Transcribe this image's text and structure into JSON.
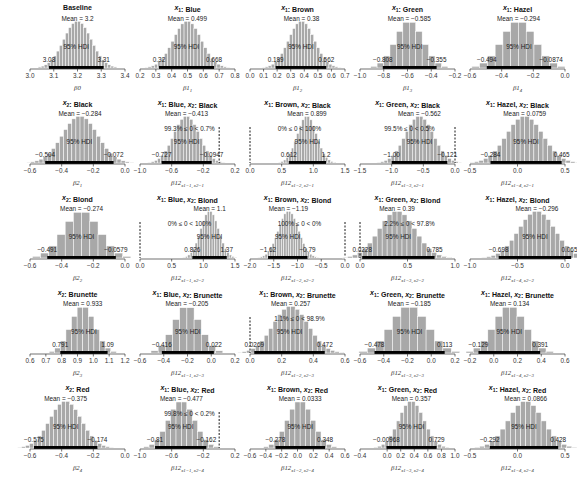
{
  "chart_data": {
    "type": "histogram-grid",
    "title": "",
    "layout": {
      "rows": 5,
      "cols": 5
    },
    "hdi_label": "95% HDI",
    "colors": {
      "bars": "#a8a8a8",
      "bar_edge": "#ffffff",
      "hdi": "#000000",
      "axis": "#333333"
    },
    "panels": [
      {
        "id": "b0",
        "row": 0,
        "col": 0,
        "title": "Baseline",
        "xlabel": "β0",
        "xlim": [
          3.0,
          3.4
        ],
        "ticks": [
          3.0,
          3.1,
          3.2,
          3.3,
          3.4
        ],
        "mean": 3.2,
        "mean_label": "Mean = 3.2",
        "hdi": [
          3.08,
          3.31
        ],
        "hdi_labels": [
          "3.08",
          "3.31"
        ],
        "sd": 0.058,
        "nbins": 30
      },
      {
        "id": "b1_1",
        "row": 0,
        "col": 1,
        "title": "x1: Blue",
        "xlabel": "β1_1",
        "xlim": [
          0.2,
          0.8
        ],
        "ticks": [
          0.2,
          0.3,
          0.4,
          0.5,
          0.6,
          0.7,
          0.8
        ],
        "mean": 0.499,
        "mean_label": "Mean = 0.499",
        "hdi": [
          0.32,
          0.668
        ],
        "hdi_labels": [
          "0.32",
          "0.668"
        ],
        "sd": 0.088,
        "nbins": 28
      },
      {
        "id": "b1_2",
        "row": 0,
        "col": 2,
        "title": "x1: Brown",
        "xlabel": "β1_2",
        "xlim": [
          0.0,
          0.7
        ],
        "ticks": [
          0.0,
          0.1,
          0.2,
          0.3,
          0.4,
          0.5,
          0.6,
          0.7
        ],
        "mean": 0.38,
        "mean_label": "Mean = 0.38",
        "hdi": [
          0.189,
          0.562
        ],
        "hdi_labels": [
          "0.189",
          "0.562"
        ],
        "sd": 0.095,
        "nbins": 28
      },
      {
        "id": "b1_3",
        "row": 0,
        "col": 3,
        "title": "x1: Green",
        "xlabel": "β1_3",
        "xlim": [
          -1.0,
          -0.2
        ],
        "ticks": [
          -1.0,
          -0.8,
          -0.6,
          -0.4,
          -0.2
        ],
        "mean": -0.585,
        "mean_label": "Mean = -0.585",
        "hdi": [
          -0.808,
          -0.355
        ],
        "hdi_labels": [
          "-0.808",
          "-0.355"
        ],
        "sd": 0.115,
        "nbins": 14
      },
      {
        "id": "b1_4",
        "row": 0,
        "col": 4,
        "title": "x1: Hazel",
        "xlabel": "β1_4",
        "xlim": [
          -0.6,
          0.0
        ],
        "ticks": [
          -0.6,
          -0.4,
          -0.2,
          0.0
        ],
        "mean": -0.294,
        "mean_label": "Mean = -0.294",
        "hdi": [
          -0.494,
          -0.0874
        ],
        "hdi_labels": [
          "-0.494",
          "-0.0874"
        ],
        "sd": 0.104,
        "nbins": 14
      },
      {
        "id": "b2_1",
        "row": 1,
        "col": 0,
        "title": "x2: Black",
        "xlabel": "β2_1",
        "xlim": [
          -0.6,
          0.0
        ],
        "ticks": [
          -0.6,
          -0.4,
          -0.2,
          0.0
        ],
        "mean": -0.284,
        "mean_label": "Mean = -0.284",
        "hdi": [
          -0.504,
          -0.072
        ],
        "hdi_labels": [
          "-0.504",
          "-0.072"
        ],
        "sd": 0.11,
        "nbins": 28
      },
      {
        "id": "b12_11",
        "row": 1,
        "col": 1,
        "title": "x1: Blue, x2: Black",
        "xlabel": "β12_{x1=1, x2=1}",
        "xlim": [
          -1.0,
          0.2
        ],
        "ticks": [
          -1.0,
          -0.6,
          -0.2,
          0.2
        ],
        "mean": -0.413,
        "mean_label": "Mean = -0.413",
        "hdi": [
          -0.727,
          -0.0947
        ],
        "hdi_labels": [
          "-0.727",
          "-0.0947"
        ],
        "sd": 0.16,
        "nbins": 26,
        "comp_label": "99.3% ≤ 0 < 0.7%",
        "comp_value": 0
      },
      {
        "id": "b12_21",
        "row": 1,
        "col": 2,
        "title": "x1: Brown, x2: Black",
        "xlabel": "β12_{x1=2, x2=1}",
        "xlim": [
          0.0,
          1.5
        ],
        "ticks": [
          0.0,
          0.5,
          1.0,
          1.5
        ],
        "mean": 0.899,
        "mean_label": "Mean = 0.899",
        "hdi": [
          0.612,
          1.2
        ],
        "hdi_labels": [
          "0.612",
          "1.2"
        ],
        "sd": 0.15,
        "nbins": 24,
        "comp_label": "0% ≤ 0 < 100%",
        "comp_value": 0
      },
      {
        "id": "b12_31",
        "row": 1,
        "col": 3,
        "title": "x1: Green, x2: Black",
        "xlabel": "β12_{x1=3, x2=1}",
        "xlim": [
          -1.5,
          0.0
        ],
        "ticks": [
          -1.5,
          -1.0,
          -0.5,
          0.0
        ],
        "mean": -0.562,
        "mean_label": "Mean = -0.562",
        "hdi": [
          -1.0,
          -0.121
        ],
        "hdi_labels": [
          "-1.00",
          "-0.121"
        ],
        "sd": 0.22,
        "nbins": 26,
        "comp_label": "99.5% ≤ 0 < 0.5%",
        "comp_value": 0
      },
      {
        "id": "b12_41",
        "row": 1,
        "col": 4,
        "title": "x1: Hazel, x2: Black",
        "xlabel": "β12_{x1=4, x2=1}",
        "xlim": [
          -0.5,
          0.5
        ],
        "ticks": [
          -0.5,
          0.0,
          0.5
        ],
        "mean": 0.0759,
        "mean_label": "Mean = 0.0759",
        "hdi": [
          -0.284,
          0.465
        ],
        "hdi_labels": [
          "-0.284",
          "0.465"
        ],
        "sd": 0.19,
        "nbins": 26
      },
      {
        "id": "b2_2",
        "row": 2,
        "col": 0,
        "title": "x2: Blond",
        "xlabel": "β2_2",
        "xlim": [
          -0.6,
          0.0
        ],
        "ticks": [
          -0.6,
          -0.4,
          -0.2,
          0.0
        ],
        "mean": -0.274,
        "mean_label": "Mean = -0.274",
        "hdi": [
          -0.491,
          -0.0579
        ],
        "hdi_labels": [
          "-0.491",
          "-0.0579"
        ],
        "sd": 0.11,
        "nbins": 14
      },
      {
        "id": "b12_12",
        "row": 2,
        "col": 1,
        "title": "x1: Blue, x2: Blond",
        "xlabel": "β12_{x1=1, x2=2}",
        "xlim": [
          0.0,
          1.5
        ],
        "ticks": [
          0.0,
          0.5,
          1.0,
          1.5
        ],
        "mean": 1.1,
        "mean_label": "Mean = 1.1",
        "hdi": [
          0.826,
          1.37
        ],
        "hdi_labels": [
          "0.826",
          "1.37"
        ],
        "sd": 0.14,
        "nbins": 24,
        "comp_label": "0% ≤ 0 < 100%",
        "comp_value": 0
      },
      {
        "id": "b12_22",
        "row": 2,
        "col": 2,
        "title": "x1: Brown, x2: Blond",
        "xlabel": "β12_{x1=2, x2=2}",
        "xlim": [
          -2.0,
          0.0
        ],
        "ticks": [
          -2.0,
          -1.5,
          -1.0,
          -0.5,
          0.0
        ],
        "mean": -1.19,
        "mean_label": "Mean = -1.19",
        "hdi": [
          -1.62,
          -0.79
        ],
        "hdi_labels": [
          "-1.62",
          "-0.79"
        ],
        "sd": 0.21,
        "nbins": 28,
        "comp_label": "100% ≤ 0 < 0%",
        "comp_value": 0
      },
      {
        "id": "b12_32",
        "row": 2,
        "col": 3,
        "title": "x1: Green, x2: Blond",
        "xlabel": "β12_{x1=3, x2=2}",
        "xlim": [
          0.0,
          1.0
        ],
        "ticks": [
          0.0,
          0.5,
          1.0
        ],
        "mean": 0.39,
        "mean_label": "Mean = 0.39",
        "hdi": [
          0.0228,
          0.785
        ],
        "hdi_labels": [
          "0.0228",
          "0.785"
        ],
        "sd": 0.19,
        "nbins": 24,
        "comp_label": "2.2% ≤ 0 < 97.8%",
        "comp_value": 0
      },
      {
        "id": "b12_42",
        "row": 2,
        "col": 4,
        "title": "x1: Hazel, x2: Blond",
        "xlabel": "β12_{x1=4, x2=2}",
        "xlim": [
          -1.0,
          0.0
        ],
        "ticks": [
          -1.0,
          -0.5,
          0.0
        ],
        "mean": -0.296,
        "mean_label": "Mean = -0.296",
        "hdi": [
          -0.698,
          0.0655
        ],
        "hdi_labels": [
          "-0.698",
          "0.0655"
        ],
        "sd": 0.19,
        "nbins": 26
      },
      {
        "id": "b2_3",
        "row": 3,
        "col": 0,
        "title": "x2: Brunette",
        "xlabel": "β2_3",
        "xlim": [
          0.6,
          1.2
        ],
        "ticks": [
          0.6,
          0.7,
          0.8,
          0.9,
          1.0,
          1.1,
          1.2
        ],
        "mean": 0.933,
        "mean_label": "Mean = 0.933",
        "hdi": [
          0.791,
          1.09
        ],
        "hdi_labels": [
          "0.791",
          "1.09"
        ],
        "sd": 0.075,
        "nbins": 14
      },
      {
        "id": "b12_13",
        "row": 3,
        "col": 1,
        "title": "x1: Blue, x2: Brunette",
        "xlabel": "β12_{x1=1, x2=3}",
        "xlim": [
          -0.6,
          0.2
        ],
        "ticks": [
          -0.6,
          -0.4,
          -0.2,
          0.0,
          0.2
        ],
        "mean": -0.205,
        "mean_label": "Mean = -0.205",
        "hdi": [
          -0.416,
          0.022
        ],
        "hdi_labels": [
          "-0.416",
          "0.022"
        ],
        "sd": 0.11,
        "nbins": 12
      },
      {
        "id": "b12_23",
        "row": 3,
        "col": 2,
        "title": "x1: Brown, x2: Brunette",
        "xlabel": "β12_{x1=2, x2=3}",
        "xlim": [
          0.0,
          0.6
        ],
        "ticks": [
          0.0,
          0.2,
          0.4,
          0.6
        ],
        "mean": 0.257,
        "mean_label": "Mean = 0.257",
        "hdi": [
          0.0269,
          0.472
        ],
        "hdi_labels": [
          "0.0269",
          "0.472"
        ],
        "sd": 0.11,
        "nbins": 26,
        "comp_label": "1.1% ≤ 0 < 98.9%",
        "comp_value": 0
      },
      {
        "id": "b12_33",
        "row": 3,
        "col": 3,
        "title": "x1: Green, x2: Brunette",
        "xlabel": "β12_{x1=3, x2=3}",
        "xlim": [
          -0.6,
          0.2
        ],
        "ticks": [
          -0.6,
          -0.4,
          -0.2,
          0.0,
          0.2
        ],
        "mean": -0.185,
        "mean_label": "Mean = -0.185",
        "hdi": [
          -0.478,
          0.113
        ],
        "hdi_labels": [
          "-0.478",
          "0.113"
        ],
        "sd": 0.15,
        "nbins": 14
      },
      {
        "id": "b12_43",
        "row": 3,
        "col": 4,
        "title": "x1: Hazel, x2: Brunette",
        "xlabel": "β12_{x1=4, x2=3}",
        "xlim": [
          -0.2,
          0.6
        ],
        "ticks": [
          -0.2,
          0.0,
          0.2,
          0.4,
          0.6
        ],
        "mean": 0.134,
        "mean_label": "Mean = 0.134",
        "hdi": [
          -0.129,
          0.391
        ],
        "hdi_labels": [
          "-0.129",
          "0.391"
        ],
        "sd": 0.13,
        "nbins": 14
      },
      {
        "id": "b2_4",
        "row": 4,
        "col": 0,
        "title": "x2: Red",
        "xlabel": "β2_4",
        "xlim": [
          -0.6,
          0.0
        ],
        "ticks": [
          -0.6,
          -0.4,
          -0.2,
          0.0
        ],
        "mean": -0.375,
        "mean_label": "Mean = -0.375",
        "hdi": [
          -0.575,
          -0.174
        ],
        "hdi_labels": [
          "-0.575",
          "-0.174"
        ],
        "sd": 0.1,
        "nbins": 26
      },
      {
        "id": "b12_14",
        "row": 4,
        "col": 1,
        "title": "x1: Blue, x2: Red",
        "xlabel": "β12_{x1=1, x2=4}",
        "xlim": [
          -1.0,
          0.2
        ],
        "ticks": [
          -1.0,
          -0.6,
          -0.2,
          0.2
        ],
        "mean": -0.477,
        "mean_label": "Mean = -0.477",
        "hdi": [
          -0.81,
          -0.162
        ],
        "hdi_labels": [
          "-0.81",
          "-0.162"
        ],
        "sd": 0.165,
        "nbins": 16,
        "comp_label": "99.8% ≤ 0 < 0.2%",
        "comp_value": 0
      },
      {
        "id": "b12_24",
        "row": 4,
        "col": 2,
        "title": "x1: Brown, x2: Red",
        "xlabel": "β12_{x1=2, x2=4}",
        "xlim": [
          -0.6,
          0.6
        ],
        "ticks": [
          -0.6,
          -0.4,
          -0.2,
          0.0,
          0.2,
          0.4,
          0.6
        ],
        "mean": 0.0333,
        "mean_label": "Mean = 0.0333",
        "hdi": [
          -0.278,
          0.348
        ],
        "hdi_labels": [
          "-0.278",
          "0.348"
        ],
        "sd": 0.16,
        "nbins": 16
      },
      {
        "id": "b12_34",
        "row": 4,
        "col": 3,
        "title": "x1: Green, x2: Red",
        "xlabel": "β12_{x1=3, x2=4}",
        "xlim": [
          -0.4,
          1.0
        ],
        "ticks": [
          -0.4,
          0.0,
          0.2,
          0.4,
          0.6,
          0.8,
          1.0
        ],
        "mean": 0.357,
        "mean_label": "Mean = 0.357",
        "hdi": [
          -0.00968,
          0.729
        ],
        "hdi_labels": [
          "-0.00968",
          "0.729"
        ],
        "sd": 0.185,
        "nbins": 22
      },
      {
        "id": "b12_44",
        "row": 4,
        "col": 4,
        "title": "x1: Hazel, x2: Red",
        "xlabel": "β12_{x1=4, x2=4}",
        "xlim": [
          -0.5,
          0.5
        ],
        "ticks": [
          -0.5,
          0.0,
          0.5
        ],
        "mean": 0.0866,
        "mean_label": "Mean = 0.0866",
        "hdi": [
          -0.292,
          0.428
        ],
        "hdi_labels": [
          "-0.292",
          "0.428"
        ],
        "sd": 0.18,
        "nbins": 22
      }
    ]
  }
}
